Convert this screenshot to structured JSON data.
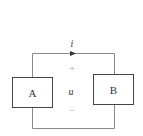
{
  "diagram": {
    "type": "circuit",
    "current_label": "i",
    "voltage_label": "u",
    "plus_sign": "+",
    "minus_sign": "−",
    "components": [
      {
        "id": "A",
        "label": "A"
      },
      {
        "id": "B",
        "label": "B"
      }
    ],
    "colors": {
      "wire": "#8a8a8a",
      "box_border": "#444444",
      "text": "#333333",
      "sign": "#aaaaaa"
    }
  }
}
